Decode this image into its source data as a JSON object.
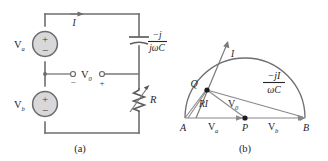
{
  "figure": {
    "panels": [
      {
        "caption": "(a)",
        "name": "circuit-schematic"
      },
      {
        "caption": "(b)",
        "name": "phasor-diagram"
      }
    ]
  },
  "circuit": {
    "current_label": "I",
    "source_top": {
      "label": "V",
      "subscript": "a",
      "plus": "+",
      "minus": "−"
    },
    "source_bottom": {
      "label": "V",
      "subscript": "b",
      "plus": "+",
      "minus": "−"
    },
    "output": {
      "label": "V",
      "subscript": "0",
      "left_terminal_sign": "−",
      "right_terminal_sign": "+"
    },
    "capacitor": {
      "numerator": "−j",
      "denominator": "jωC"
    },
    "resistor": {
      "label": "R"
    }
  },
  "phasor": {
    "point_a": "A",
    "point_b": "B",
    "point_p": "P",
    "point_q": "Q",
    "current_label": "I",
    "ri_label": "RI",
    "v0_label": "V",
    "v0_subscript": "0",
    "va_left_label": "V",
    "va_left_subscript": "a",
    "vb_right_label": "V",
    "vb_right_subscript": "b",
    "capacitor_drop": {
      "numerator": "−jI",
      "denominator": "ωC"
    }
  },
  "colors": {
    "wire": "#6e6e70",
    "source_fill": "#d8d8da",
    "text": "#252527",
    "background": "#ffffff"
  }
}
